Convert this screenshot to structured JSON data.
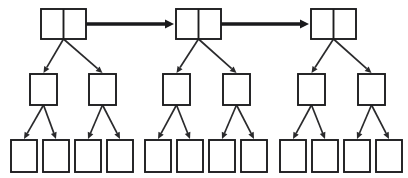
{
  "diagram": {
    "type": "node-link-diagram",
    "canvas": {
      "width": 408,
      "height": 178,
      "background": "#ffffff"
    },
    "colors": {
      "node_stroke": "#1d1d1f",
      "node_fill": "#ffffff",
      "child_link": "#2a2a2c",
      "sibling_link": "#1a1a1c"
    },
    "style": {
      "root_node_cells": 2,
      "middle_node_cells": 1,
      "leaf_node_cells": 1,
      "sibling_link_stroke_width": 3.4,
      "child_link_stroke_width": 1.7,
      "node_stroke_width": 1.9
    },
    "counts": {
      "groups": 3,
      "roots": 3,
      "middle_nodes_per_group": 2,
      "leaf_nodes_per_group": 4,
      "total_nodes": 21,
      "sibling_arrows": 2,
      "child_arrows": 18
    },
    "groups": [
      {
        "id": "group-1",
        "root": {
          "id": "root-1",
          "x": 41,
          "y": 9,
          "width": 45,
          "height": 30,
          "label": ""
        },
        "middle": [
          {
            "id": "g1-mid-1",
            "x": 30,
            "y": 74,
            "width": 27,
            "height": 31,
            "label": ""
          },
          {
            "id": "g1-mid-2",
            "x": 89,
            "y": 74,
            "width": 27,
            "height": 31,
            "label": ""
          }
        ],
        "leaves": [
          {
            "id": "g1-leaf-1",
            "x": 11,
            "y": 140,
            "width": 26,
            "height": 32,
            "label": ""
          },
          {
            "id": "g1-leaf-2",
            "x": 43,
            "y": 140,
            "width": 26,
            "height": 32,
            "label": ""
          },
          {
            "id": "g1-leaf-3",
            "x": 75,
            "y": 140,
            "width": 26,
            "height": 32,
            "label": ""
          },
          {
            "id": "g1-leaf-4",
            "x": 107,
            "y": 140,
            "width": 26,
            "height": 32,
            "label": ""
          }
        ]
      },
      {
        "id": "group-2",
        "root": {
          "id": "root-2",
          "x": 176,
          "y": 9,
          "width": 45,
          "height": 30,
          "label": ""
        },
        "middle": [
          {
            "id": "g2-mid-1",
            "x": 163,
            "y": 74,
            "width": 27,
            "height": 31,
            "label": ""
          },
          {
            "id": "g2-mid-2",
            "x": 223,
            "y": 74,
            "width": 27,
            "height": 31,
            "label": ""
          }
        ],
        "leaves": [
          {
            "id": "g2-leaf-1",
            "x": 145,
            "y": 140,
            "width": 26,
            "height": 32,
            "label": ""
          },
          {
            "id": "g2-leaf-2",
            "x": 177,
            "y": 140,
            "width": 26,
            "height": 32,
            "label": ""
          },
          {
            "id": "g2-leaf-3",
            "x": 209,
            "y": 140,
            "width": 26,
            "height": 32,
            "label": ""
          },
          {
            "id": "g2-leaf-4",
            "x": 241,
            "y": 140,
            "width": 26,
            "height": 32,
            "label": ""
          }
        ]
      },
      {
        "id": "group-3",
        "root": {
          "id": "root-3",
          "x": 311,
          "y": 9,
          "width": 45,
          "height": 30,
          "label": ""
        },
        "middle": [
          {
            "id": "g3-mid-1",
            "x": 298,
            "y": 74,
            "width": 27,
            "height": 31,
            "label": ""
          },
          {
            "id": "g3-mid-2",
            "x": 358,
            "y": 74,
            "width": 27,
            "height": 31,
            "label": ""
          }
        ],
        "leaves": [
          {
            "id": "g3-leaf-1",
            "x": 280,
            "y": 140,
            "width": 26,
            "height": 32,
            "label": ""
          },
          {
            "id": "g3-leaf-2",
            "x": 312,
            "y": 140,
            "width": 26,
            "height": 32,
            "label": ""
          },
          {
            "id": "g3-leaf-3",
            "x": 344,
            "y": 140,
            "width": 26,
            "height": 32,
            "label": ""
          },
          {
            "id": "g3-leaf-4",
            "x": 376,
            "y": 140,
            "width": 26,
            "height": 32,
            "label": ""
          }
        ]
      }
    ],
    "sibling_links": [
      {
        "id": "link-root1-root2",
        "from": "root-1",
        "to": "root-2",
        "x1": 86,
        "x2": 174,
        "y": 24
      },
      {
        "id": "link-root2-root3",
        "from": "root-2",
        "to": "root-3",
        "x1": 221,
        "x2": 309,
        "y": 24
      }
    ]
  }
}
